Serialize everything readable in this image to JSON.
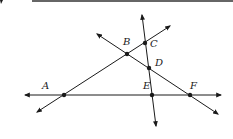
{
  "diagram": {
    "type": "geometry-lines",
    "stroke_color": "#1a1a1a",
    "points": [
      {
        "label": "A",
        "x": 64,
        "y": 95,
        "lx": 42,
        "ly": 89
      },
      {
        "label": "B",
        "x": 127,
        "y": 54,
        "lx": 123,
        "ly": 45
      },
      {
        "label": "C",
        "x": 145,
        "y": 43,
        "lx": 150,
        "ly": 47
      },
      {
        "label": "D",
        "x": 149,
        "y": 68,
        "lx": 155,
        "ly": 66
      },
      {
        "label": "E",
        "x": 152,
        "y": 95,
        "lx": 143,
        "ly": 89
      },
      {
        "label": "F",
        "x": 190,
        "y": 95,
        "lx": 190,
        "ly": 89
      }
    ],
    "lines": [
      {
        "name": "line-AE-horizontal",
        "x1": 25,
        "y1": 95,
        "x2": 221,
        "y2": 95
      },
      {
        "name": "line-ABC",
        "x1": 37,
        "y1": 112,
        "x2": 170,
        "y2": 26
      },
      {
        "name": "line-BDF",
        "x1": 97,
        "y1": 34,
        "x2": 218,
        "y2": 114
      },
      {
        "name": "line-CDE",
        "x1": 142,
        "y1": 15,
        "x2": 156,
        "y2": 126
      }
    ]
  }
}
